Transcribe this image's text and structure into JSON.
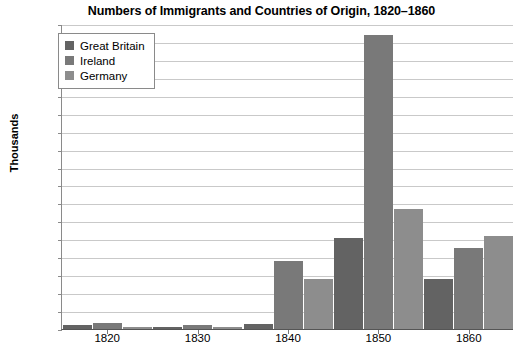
{
  "chart_data": {
    "type": "bar",
    "title": "Numbers of Immigrants and Countries of Origin, 1820–1860",
    "xlabel": "",
    "ylabel": "Thousands",
    "categories": [
      "1820",
      "1830",
      "1840",
      "1850",
      "1860"
    ],
    "series": [
      {
        "name": "Great Britain",
        "color": "#636363",
        "values": [
          2.4,
          1.2,
          2.6,
          51,
          28
        ]
      },
      {
        "name": "Ireland",
        "color": "#797979",
        "values": [
          3.6,
          2.0,
          38,
          164,
          45
        ]
      },
      {
        "name": "Germany",
        "color": "#8d8d8d",
        "values": [
          0.9,
          1.0,
          28,
          67,
          52
        ]
      }
    ],
    "ylim": [
      0,
      170
    ],
    "ytick_step": 10,
    "yticks": [
      "170",
      "160",
      "150",
      "140",
      "130",
      "120",
      "110",
      "100",
      "90",
      "80",
      "70",
      "60",
      "50",
      "40",
      "30",
      "20",
      "10",
      "0"
    ],
    "grid": true,
    "legend_position": "top-left"
  },
  "colors": {
    "great_britain": "#636363",
    "ireland": "#797979",
    "germany": "#8d8d8d",
    "gridline": "#c9c9c9",
    "axis": "#555555",
    "background": "#ffffff",
    "text": "#000000"
  }
}
